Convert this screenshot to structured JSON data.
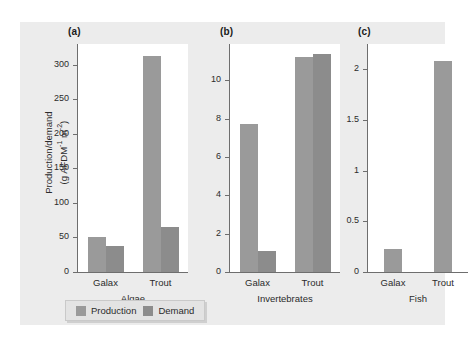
{
  "figure": {
    "background": "#ececec",
    "panel_background": "#ffffff",
    "axis_color": "#6e6e6e"
  },
  "ylabel": {
    "line1": "Production/demand",
    "line2_pre": "(g AFDM",
    "line2_sup1": "-1",
    "line2_mid": " m",
    "line2_sup2": "-2",
    "line2_post": ")"
  },
  "legend": {
    "production_label": "Production",
    "demand_label": "Demand",
    "production_color": "#9a9a9a",
    "demand_color": "#8c8c8c"
  },
  "panels": [
    {
      "label": "(a)",
      "group_title": "Algae",
      "categories": [
        "Galax",
        "Trout"
      ],
      "ticks": [
        "0",
        "50",
        "100",
        "150",
        "200",
        "250",
        "300"
      ],
      "tickvals": [
        0,
        50,
        100,
        150,
        200,
        250,
        300
      ],
      "ymax": 330,
      "production": [
        50,
        312
      ],
      "demand": [
        37,
        65
      ]
    },
    {
      "label": "(b)",
      "group_title": "Invertebrates",
      "categories": [
        "Galax",
        "Trout"
      ],
      "ticks": [
        "0",
        "2",
        "4",
        "6",
        "8",
        "10"
      ],
      "tickvals": [
        0,
        2,
        4,
        6,
        8,
        10
      ],
      "ymax": 11.9,
      "production": [
        7.7,
        11.2
      ],
      "demand": [
        1.1,
        11.4
      ]
    },
    {
      "label": "(c)",
      "group_title": "Fish",
      "categories": [
        "Galax",
        "Trout"
      ],
      "ticks": [
        "0",
        "0.5",
        "1",
        "1.5",
        "2"
      ],
      "tickvals": [
        0,
        0.5,
        1,
        1.5,
        2
      ],
      "ymax": 2.25,
      "production": [
        0.23,
        2.08
      ],
      "demand": [
        null,
        null
      ]
    }
  ],
  "chart_data": {
    "type": "bar",
    "title": "",
    "xlabel": "",
    "ylabel": "Production/demand (g AFDM-1 m-2)",
    "legend_position": "bottom",
    "grid": false,
    "subplots": [
      {
        "panel": "(a)",
        "subtitle": "Algae",
        "categories": [
          "Galax",
          "Trout"
        ],
        "series": [
          {
            "name": "Production",
            "values": [
              50,
              312
            ]
          },
          {
            "name": "Demand",
            "values": [
              37,
              65
            ]
          }
        ],
        "ylim": [
          0,
          330
        ],
        "yticks": [
          0,
          50,
          100,
          150,
          200,
          250,
          300
        ]
      },
      {
        "panel": "(b)",
        "subtitle": "Invertebrates",
        "categories": [
          "Galax",
          "Trout"
        ],
        "series": [
          {
            "name": "Production",
            "values": [
              7.7,
              11.2
            ]
          },
          {
            "name": "Demand",
            "values": [
              1.1,
              11.4
            ]
          }
        ],
        "ylim": [
          0,
          11.9
        ],
        "yticks": [
          0,
          2,
          4,
          6,
          8,
          10
        ]
      },
      {
        "panel": "(c)",
        "subtitle": "Fish",
        "categories": [
          "Galax",
          "Trout"
        ],
        "series": [
          {
            "name": "Production",
            "values": [
              0.23,
              2.08
            ]
          },
          {
            "name": "Demand",
            "values": [
              null,
              null
            ]
          }
        ],
        "ylim": [
          0,
          2.25
        ],
        "yticks": [
          0,
          0.5,
          1,
          1.5,
          2
        ]
      }
    ]
  }
}
